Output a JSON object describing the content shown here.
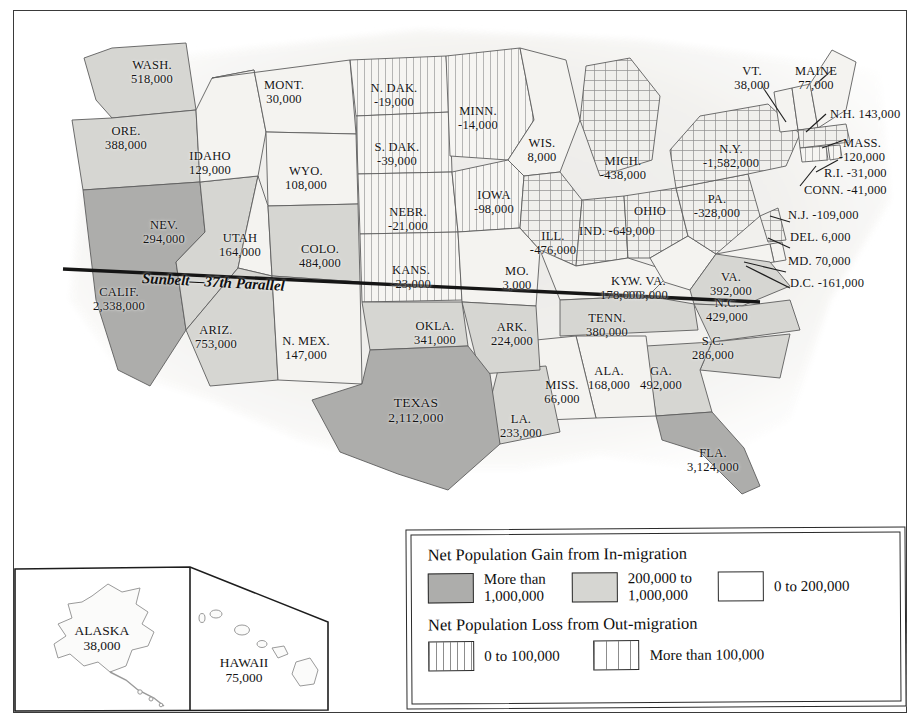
{
  "map": {
    "title": "Net Population Gain and Loss by State (In-migration / Out-migration)",
    "sunbelt_caption": "Sunbelt—37th Parallel",
    "colors": {
      "gain_high": "#adadab",
      "gain_mid": "#d6d6d2",
      "gain_low": "#f4f3f0",
      "loss_pattern": "#8d8d8d",
      "border": "#5d5d5d",
      "frame": "#3a3a3a",
      "text": "#141414"
    }
  },
  "legend": {
    "gain_heading": "Net Population Gain from In-migration",
    "loss_heading": "Net Population Loss from Out-migration",
    "gain_items": [
      {
        "swatch": "gain-high-swatch",
        "line1": "More than",
        "line2": "1,000,000"
      },
      {
        "swatch": "gain-mid-swatch",
        "line1": "200,000 to",
        "line2": "1,000,000"
      },
      {
        "swatch": "gain-low-swatch",
        "line1": "0 to 200,000",
        "line2": ""
      }
    ],
    "loss_items": [
      {
        "swatch": "loss-low-swatch",
        "line1": "0 to 100,000",
        "line2": ""
      },
      {
        "swatch": "loss-high-swatch",
        "line1": "More than 100,000",
        "line2": ""
      }
    ]
  },
  "states": [
    {
      "abbr": "WASH.",
      "value": "518,000",
      "category": "gain-mid"
    },
    {
      "abbr": "ORE.",
      "value": "388,000",
      "category": "gain-mid"
    },
    {
      "abbr": "MONT.",
      "value": "30,000",
      "category": "gain-low"
    },
    {
      "abbr": "IDAHO",
      "value": "129,000",
      "category": "gain-low"
    },
    {
      "abbr": "WYO.",
      "value": "108,000",
      "category": "gain-low"
    },
    {
      "abbr": "NEV.",
      "value": "294,000",
      "category": "gain-mid"
    },
    {
      "abbr": "UTAH",
      "value": "164,000",
      "category": "gain-low"
    },
    {
      "abbr": "COLO.",
      "value": "484,000",
      "category": "gain-mid"
    },
    {
      "abbr": "CALIF.",
      "value": "2,338,000",
      "category": "gain-high"
    },
    {
      "abbr": "ARIZ.",
      "value": "753,000",
      "category": "gain-mid"
    },
    {
      "abbr": "N. MEX.",
      "value": "147,000",
      "category": "gain-low"
    },
    {
      "abbr": "N. DAK.",
      "value": "-19,000",
      "category": "loss-low"
    },
    {
      "abbr": "S. DAK.",
      "value": "-39,000",
      "category": "loss-low"
    },
    {
      "abbr": "NEBR.",
      "value": "-21,000",
      "category": "loss-low"
    },
    {
      "abbr": "KANS.",
      "value": "-23,000",
      "category": "loss-low"
    },
    {
      "abbr": "MINN.",
      "value": "-14,000",
      "category": "loss-low"
    },
    {
      "abbr": "IOWA",
      "value": "-98,000",
      "category": "loss-low"
    },
    {
      "abbr": "MO.",
      "value": "3,000",
      "category": "gain-low"
    },
    {
      "abbr": "WIS.",
      "value": "8,000",
      "category": "gain-low"
    },
    {
      "abbr": "ILL.",
      "value": "-476,000",
      "category": "loss-high"
    },
    {
      "abbr": "MICH.",
      "value": "-438,000",
      "category": "loss-high"
    },
    {
      "abbr": "IND.",
      "value": "-160,000",
      "category": "loss-high"
    },
    {
      "abbr": "OHIO",
      "value": "-649,000",
      "category": "loss-high"
    },
    {
      "abbr": "KY.",
      "value": "178,000",
      "category": "gain-low"
    },
    {
      "abbr": "W. VA.",
      "value": "103,000",
      "category": "gain-low"
    },
    {
      "abbr": "PA.",
      "value": "-328,000",
      "category": "loss-high"
    },
    {
      "abbr": "N.Y.",
      "value": "-1,582,000",
      "category": "loss-high"
    },
    {
      "abbr": "VT.",
      "value": "38,000",
      "category": "gain-low"
    },
    {
      "abbr": "MAINE",
      "value": "77,000",
      "category": "gain-low"
    },
    {
      "abbr": "N.H.",
      "value": "143,000",
      "category": "gain-low"
    },
    {
      "abbr": "MASS.",
      "value": "-120,000",
      "category": "loss-high"
    },
    {
      "abbr": "R.I.",
      "value": "-31,000",
      "category": "loss-low"
    },
    {
      "abbr": "CONN.",
      "value": "-41,000",
      "category": "loss-low"
    },
    {
      "abbr": "N.J.",
      "value": "-109,000",
      "category": "loss-high"
    },
    {
      "abbr": "DEL.",
      "value": "6,000",
      "category": "gain-low"
    },
    {
      "abbr": "MD.",
      "value": "70,000",
      "category": "gain-low"
    },
    {
      "abbr": "D.C.",
      "value": "-161,000",
      "category": "loss-high"
    },
    {
      "abbr": "VA.",
      "value": "392,000",
      "category": "gain-mid"
    },
    {
      "abbr": "N.C.",
      "value": "429,000",
      "category": "gain-mid"
    },
    {
      "abbr": "S.C.",
      "value": "286,000",
      "category": "gain-mid"
    },
    {
      "abbr": "GA.",
      "value": "492,000",
      "category": "gain-mid"
    },
    {
      "abbr": "TENN.",
      "value": "380,000",
      "category": "gain-mid"
    },
    {
      "abbr": "ALA.",
      "value": "168,000",
      "category": "gain-low"
    },
    {
      "abbr": "MISS.",
      "value": "66,000",
      "category": "gain-low"
    },
    {
      "abbr": "LA.",
      "value": "233,000",
      "category": "gain-mid"
    },
    {
      "abbr": "ARK.",
      "value": "224,000",
      "category": "gain-mid"
    },
    {
      "abbr": "OKLA.",
      "value": "341,000",
      "category": "gain-mid"
    },
    {
      "abbr": "TEXAS",
      "value": "2,112,000",
      "category": "gain-high"
    },
    {
      "abbr": "FLA.",
      "value": "3,124,000",
      "category": "gain-high"
    },
    {
      "abbr": "ALASKA",
      "value": "38,000",
      "category": "gain-low"
    },
    {
      "abbr": "HAWAII",
      "value": "75,000",
      "category": "gain-low"
    }
  ],
  "labels": {
    "wash": {
      "name": "WASH.",
      "value": "518,000"
    },
    "ore": {
      "name": "ORE.",
      "value": "388,000"
    },
    "mont": {
      "name": "MONT.",
      "value": "30,000"
    },
    "idaho": {
      "name": "IDAHO",
      "value": "129,000"
    },
    "wyo": {
      "name": "WYO.",
      "value": "108,000"
    },
    "nev": {
      "name": "NEV.",
      "value": "294,000"
    },
    "utah": {
      "name": "UTAH",
      "value": "164,000"
    },
    "colo": {
      "name": "COLO.",
      "value": "484,000"
    },
    "calif": {
      "name": "CALIF.",
      "value": "2,338,000"
    },
    "ariz": {
      "name": "ARIZ.",
      "value": "753,000"
    },
    "nmex": {
      "name": "N. MEX.",
      "value": "147,000"
    },
    "ndak": {
      "name": "N. DAK.",
      "value": "-19,000"
    },
    "sdak": {
      "name": "S. DAK.",
      "value": "-39,000"
    },
    "nebr": {
      "name": "NEBR.",
      "value": "-21,000"
    },
    "kans": {
      "name": "KANS.",
      "value": "-23,000"
    },
    "minn": {
      "name": "MINN.",
      "value": "-14,000"
    },
    "iowa": {
      "name": "IOWA",
      "value": "-98,000"
    },
    "mo": {
      "name": "MO.",
      "value": "3,000"
    },
    "wis": {
      "name": "WIS.",
      "value": "8,000"
    },
    "ill": {
      "name": "ILL.",
      "value": "-476,000"
    },
    "mich": {
      "name": "MICH.",
      "value": "-438,000"
    },
    "ind": {
      "name": "IND.",
      "value": "-649,000"
    },
    "ohio": {
      "name": "OHIO",
      "value": ""
    },
    "ky": {
      "name": "KY.",
      "value": "178,000"
    },
    "wva": {
      "name": "W. VA.",
      "value": "103,000"
    },
    "pa": {
      "name": "PA.",
      "value": "-328,000"
    },
    "ny": {
      "name": "N.Y.",
      "value": "-1,582,000"
    },
    "vt": {
      "name": "VT.",
      "value": "38,000"
    },
    "maine": {
      "name": "MAINE",
      "value": "77,000"
    },
    "nh": {
      "name": "N.H. 143,000"
    },
    "mass": {
      "name": "MASS.",
      "value": "-120,000"
    },
    "ri": {
      "name": "R.I. -31,000"
    },
    "conn": {
      "name": "CONN. -41,000"
    },
    "nj": {
      "name": "N.J. -109,000"
    },
    "del": {
      "name": "DEL. 6,000"
    },
    "md": {
      "name": "MD. 70,000"
    },
    "dc": {
      "name": "D.C. -161,000"
    },
    "va": {
      "name": "VA.",
      "value": "392,000"
    },
    "nc": {
      "name": "N.C.",
      "value": "429,000"
    },
    "sc": {
      "name": "S.C.",
      "value": "286,000"
    },
    "ga": {
      "name": "GA.",
      "value": "492,000"
    },
    "tenn": {
      "name": "TENN.",
      "value": "380,000"
    },
    "ala": {
      "name": "ALA.",
      "value": "168,000"
    },
    "miss": {
      "name": "MISS.",
      "value": "66,000"
    },
    "la": {
      "name": "LA.",
      "value": "233,000"
    },
    "ark": {
      "name": "ARK.",
      "value": "224,000"
    },
    "okla": {
      "name": "OKLA.",
      "value": "341,000"
    },
    "texas": {
      "name": "TEXAS",
      "value": "2,112,000"
    },
    "fla": {
      "name": "FLA.",
      "value": "3,124,000"
    },
    "alaska": {
      "name": "ALASKA",
      "value": "38,000"
    },
    "hawaii": {
      "name": "HAWAII",
      "value": "75,000"
    }
  }
}
